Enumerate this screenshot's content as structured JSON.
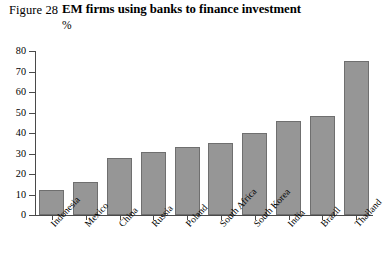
{
  "header": {
    "figure_number": "Figure 28",
    "title": "EM firms using banks to finance investment",
    "unit": "%"
  },
  "chart_data": {
    "type": "bar",
    "title": "EM firms using banks to finance investment",
    "xlabel": "",
    "ylabel": "%",
    "ylim": [
      0,
      80
    ],
    "yticks": [
      0,
      10,
      20,
      30,
      40,
      50,
      60,
      70,
      80
    ],
    "ytick_labels": [
      "0",
      "10",
      "20",
      "30",
      "40",
      "50",
      "60",
      "70",
      "80"
    ],
    "grid": false,
    "legend": false,
    "bar_color": "#969696",
    "bar_edge_color": "#6f6f6f",
    "axis_color": "#4a4a4a",
    "categories": [
      "Indonesia",
      "Mexico",
      "China",
      "Russia",
      "Poland",
      "South Africa",
      "South Korea",
      "India",
      "Brazil",
      "Thailand"
    ],
    "values": [
      12,
      16,
      28,
      30.5,
      33,
      35,
      40,
      46,
      48.5,
      75
    ]
  }
}
